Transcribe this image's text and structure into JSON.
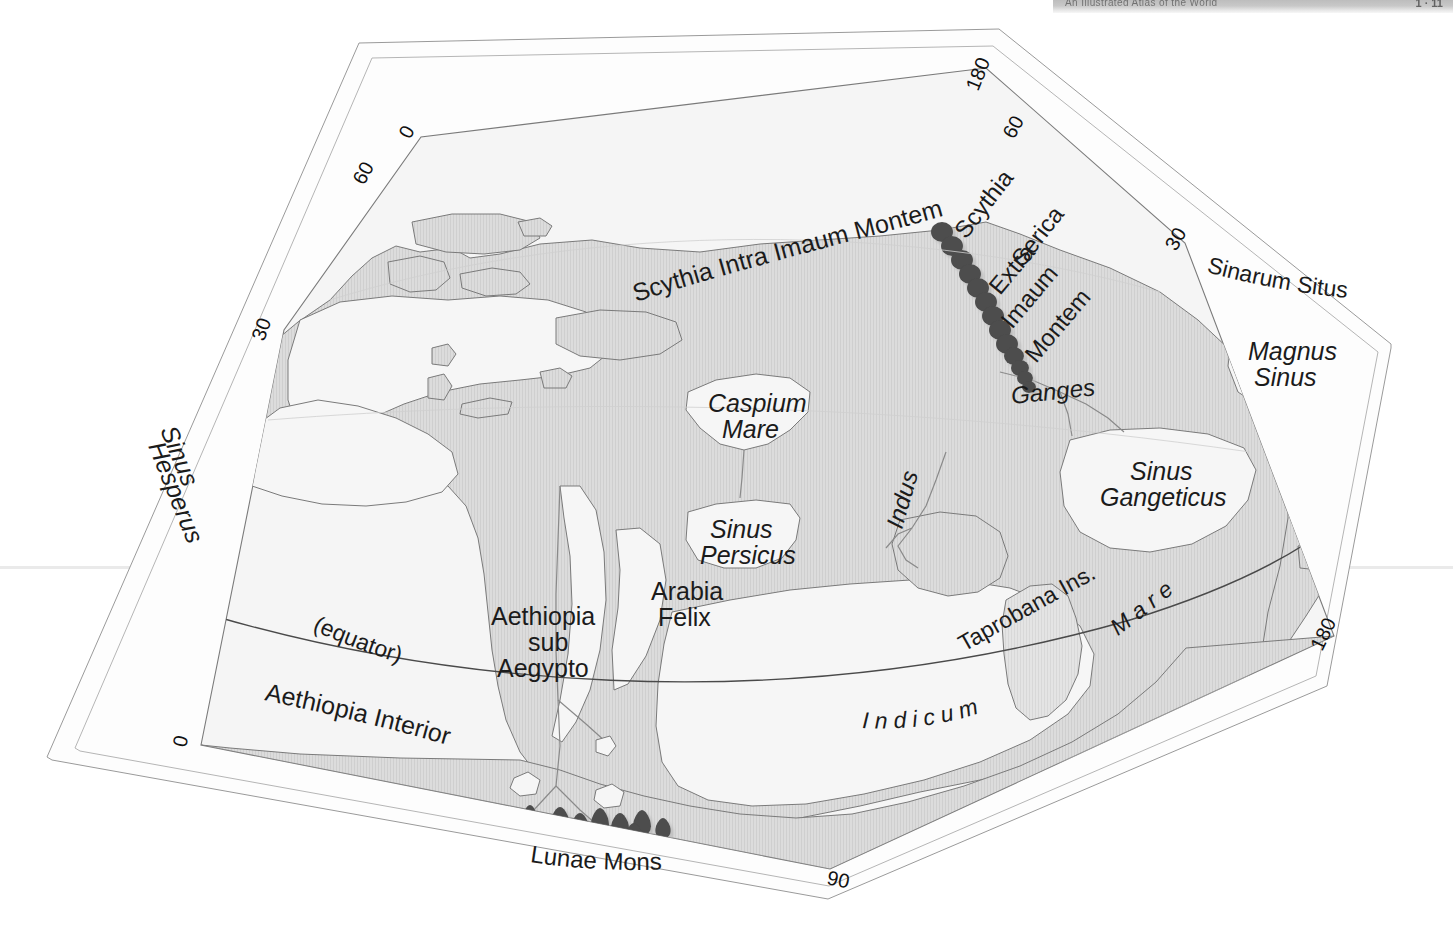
{
  "page": {
    "header_text": "An Illustrated Atlas of the World",
    "folio": "1 · 11",
    "plate_title": "Ptolemaic World Map"
  },
  "map": {
    "projection": "conic",
    "colors": {
      "land": "#d8d8d8",
      "sea": "#f4f4f4",
      "outline": "#6b6b6b",
      "frame": "#8a8a8a",
      "mountain": "#4a4a4a",
      "mountain_shadow": "#7d7d7d",
      "text": "#1b1b1b",
      "page_background": "#ffffff"
    },
    "graticule_labels": [
      {
        "id": "lat-0-topleft",
        "value": "0",
        "x": 410,
        "y": 140
      },
      {
        "id": "lat-60-topleft",
        "value": "60",
        "x": 370,
        "y": 182
      },
      {
        "id": "lat-30-left",
        "value": "30",
        "x": 272,
        "y": 338
      },
      {
        "id": "lat-0-bottomleft",
        "value": "0",
        "x": 192,
        "y": 745
      },
      {
        "id": "lon-180-topright",
        "value": "180",
        "x": 990,
        "y": 75
      },
      {
        "id": "lon-60-topright",
        "value": "60",
        "x": 1022,
        "y": 130
      },
      {
        "id": "lon-30-right",
        "value": "30",
        "x": 1183,
        "y": 248
      },
      {
        "id": "lon-180-botright",
        "value": "180",
        "x": 1335,
        "y": 638
      },
      {
        "id": "lon-90-bottom",
        "value": "90",
        "x": 838,
        "y": 877
      }
    ],
    "equator_label": "(equator)",
    "regions": [
      {
        "id": "scythia-intra",
        "text": "Scythia Intra Imaum Montem",
        "style": "plain"
      },
      {
        "id": "scythia-extra-1",
        "text": "Scythia",
        "style": "plain"
      },
      {
        "id": "scythia-extra-2",
        "text": "Serica",
        "style": "plain"
      },
      {
        "id": "scythia-extra-3",
        "text": "Extra",
        "style": "plain"
      },
      {
        "id": "scythia-extra-4",
        "text": "Imaum",
        "style": "plain"
      },
      {
        "id": "scythia-extra-5",
        "text": "Montem",
        "style": "plain"
      },
      {
        "id": "sinarum-situs",
        "text": "Sinarum Situs",
        "style": "plain"
      },
      {
        "id": "aethiopia-interior",
        "text": "Aethiopia Interior",
        "style": "plain"
      },
      {
        "id": "aethiopia-sub-1",
        "text": "Aethiopia",
        "style": "plain"
      },
      {
        "id": "aethiopia-sub-2",
        "text": "sub",
        "style": "plain"
      },
      {
        "id": "aethiopia-sub-3",
        "text": "Aegypto",
        "style": "plain"
      },
      {
        "id": "arabia-felix-1",
        "text": "Arabia",
        "style": "plain"
      },
      {
        "id": "arabia-felix-2",
        "text": "Felix",
        "style": "plain"
      },
      {
        "id": "taprobana",
        "text": "Taprobana Ins.",
        "style": "plain"
      },
      {
        "id": "lunae-mons",
        "text": "Lunae Mons",
        "style": "plain"
      }
    ],
    "water_labels": [
      {
        "id": "sinus-hesperus-1",
        "text": "Sinus",
        "style": "italic"
      },
      {
        "id": "sinus-hesperus-2",
        "text": "Hesperus",
        "style": "italic"
      },
      {
        "id": "caspium-mare-1",
        "text": "Caspium",
        "style": "italic"
      },
      {
        "id": "caspium-mare-2",
        "text": "Mare",
        "style": "italic"
      },
      {
        "id": "sinus-persicus-1",
        "text": "Sinus",
        "style": "italic"
      },
      {
        "id": "sinus-persicus-2",
        "text": "Persicus",
        "style": "italic"
      },
      {
        "id": "sinus-gangeticus-1",
        "text": "Sinus",
        "style": "italic"
      },
      {
        "id": "sinus-gangeticus-2",
        "text": "Gangeticus",
        "style": "italic"
      },
      {
        "id": "magnus-sinus-1",
        "text": "Magnus",
        "style": "italic"
      },
      {
        "id": "magnus-sinus-2",
        "text": "Sinus",
        "style": "italic"
      },
      {
        "id": "mare-indicum-1",
        "text": "M a r e",
        "style": "italic"
      },
      {
        "id": "mare-indicum-2",
        "text": "I n d i c u m",
        "style": "italic"
      }
    ],
    "rivers": [
      {
        "id": "indus",
        "text": "Indus",
        "style": "italic"
      },
      {
        "id": "ganges",
        "text": "Ganges",
        "style": "italic"
      }
    ],
    "mountain_ranges": [
      {
        "id": "imaus-montes",
        "label": "",
        "peaks": 13
      },
      {
        "id": "lunae-montes",
        "label": "Lunae Mons",
        "peaks": 11
      }
    ]
  }
}
